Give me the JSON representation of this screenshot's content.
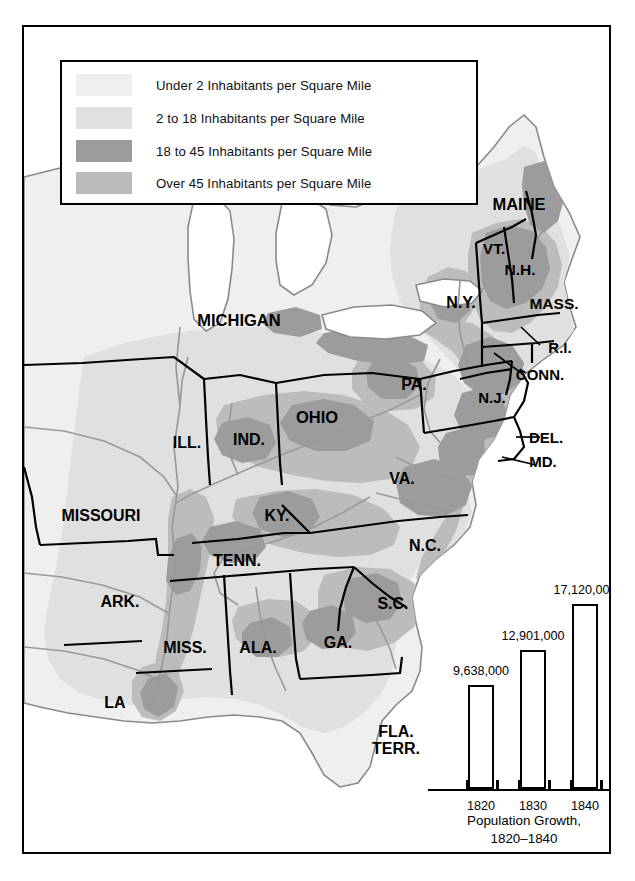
{
  "colors": {
    "tier_under2": "#efefef",
    "tier_2to18": "#e0e0e0",
    "tier_18to45": "#9c9c9c",
    "tier_over45": "#bcbcbc",
    "ocean": "#ffffff",
    "lake": "#ffffff",
    "border": "#000000",
    "coastline": "#8a8a8a",
    "frame": "#000000"
  },
  "legend": {
    "items": [
      {
        "label": "Under 2 Inhabitants per Square Mile",
        "swatch": "#efefef"
      },
      {
        "label": "2 to 18 Inhabitants per Square Mile",
        "swatch": "#e0e0e0"
      },
      {
        "label": "18 to 45 Inhabitants per Square Mile",
        "swatch": "#9c9c9c"
      },
      {
        "label": "Over 45 Inhabitants per Square Mile",
        "swatch": "#bcbcbc"
      }
    ]
  },
  "states": [
    {
      "name": "MAINE",
      "label": "MAINE",
      "x": 495,
      "y": 178,
      "size": 16.5
    },
    {
      "name": "VT",
      "label": "VT.",
      "x": 470,
      "y": 222,
      "size": 15.5
    },
    {
      "name": "NH",
      "label": "N.H.",
      "x": 496,
      "y": 243,
      "size": 15.5
    },
    {
      "name": "NY",
      "label": "N.Y.",
      "x": 437,
      "y": 276,
      "size": 16.0
    },
    {
      "name": "MASS",
      "label": "MASS.",
      "x": 530,
      "y": 277,
      "size": 15.5
    },
    {
      "name": "RI",
      "label": "R.I.",
      "x": 536,
      "y": 321,
      "size": 15.0
    },
    {
      "name": "CONN",
      "label": "CONN.",
      "x": 516,
      "y": 348,
      "size": 15.0
    },
    {
      "name": "MICHIGAN",
      "label": "MICHIGAN",
      "x": 215,
      "y": 294,
      "size": 16.5
    },
    {
      "name": "PA",
      "label": "PA.",
      "x": 390,
      "y": 358,
      "size": 16.0
    },
    {
      "name": "NJ",
      "label": "N.J.",
      "x": 468,
      "y": 371,
      "size": 15.0
    },
    {
      "name": "OHIO",
      "label": "OHIO",
      "x": 293,
      "y": 391,
      "size": 16.5
    },
    {
      "name": "ILL",
      "label": "ILL.",
      "x": 163,
      "y": 416,
      "size": 16.0
    },
    {
      "name": "IND",
      "label": "IND.",
      "x": 225,
      "y": 413,
      "size": 16.0
    },
    {
      "name": "DEL",
      "label": "DEL.",
      "x": 522,
      "y": 411,
      "size": 15.0
    },
    {
      "name": "MD",
      "label": "MD.",
      "x": 519,
      "y": 435,
      "size": 15.0
    },
    {
      "name": "VA",
      "label": "VA.",
      "x": 378,
      "y": 452,
      "size": 16.0
    },
    {
      "name": "MISSOURI",
      "label": "MISSOURI",
      "x": 77,
      "y": 489,
      "size": 16.0
    },
    {
      "name": "KY",
      "label": "KY.",
      "x": 253,
      "y": 489,
      "size": 16.0
    },
    {
      "name": "TENN",
      "label": "TENN.",
      "x": 213,
      "y": 534,
      "size": 16.0
    },
    {
      "name": "NC",
      "label": "N.C.",
      "x": 401,
      "y": 519,
      "size": 16.0
    },
    {
      "name": "ARK",
      "label": "ARK.",
      "x": 96,
      "y": 575,
      "size": 16.0
    },
    {
      "name": "SC",
      "label": "S.C.",
      "x": 369,
      "y": 577,
      "size": 16.0
    },
    {
      "name": "MISS",
      "label": "MISS.",
      "x": 161,
      "y": 621,
      "size": 16.0
    },
    {
      "name": "ALA",
      "label": "ALA.",
      "x": 234,
      "y": 621,
      "size": 16.0
    },
    {
      "name": "GA",
      "label": "GA.",
      "x": 314,
      "y": 616,
      "size": 16.0
    },
    {
      "name": "LA",
      "label": "LA",
      "x": 91,
      "y": 676,
      "size": 16.0
    },
    {
      "name": "FLA-TERR",
      "label": "FLA.\nTERR.",
      "x": 372,
      "y": 714,
      "size": 16.0
    }
  ],
  "chart_data": {
    "type": "bar",
    "title": "Population Growth,\n1820–1840",
    "title_line1": "Population Growth,",
    "title_line2": "1820–1840",
    "categories": [
      "1820",
      "1830",
      "1840"
    ],
    "values": [
      9638000,
      12901000,
      17120000
    ],
    "value_labels": [
      "9,638,000",
      "12,901,000",
      "17,120,000"
    ],
    "xlabel": "",
    "ylabel": "",
    "ylim": [
      0,
      19000000
    ],
    "grid": false,
    "legend_position": "none"
  }
}
